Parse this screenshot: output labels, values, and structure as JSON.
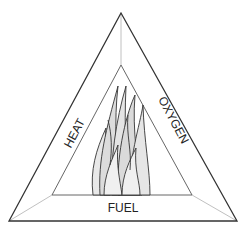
{
  "diagram": {
    "type": "fire-triangle",
    "labels": {
      "left": "HEAT",
      "right": "OXYGEN",
      "bottom": "FUEL"
    },
    "center_icon": "flame-icon",
    "colors": {
      "stroke": "#333333",
      "connector": "#aaaaaa",
      "flame_fill": "#e6e6e6"
    }
  }
}
